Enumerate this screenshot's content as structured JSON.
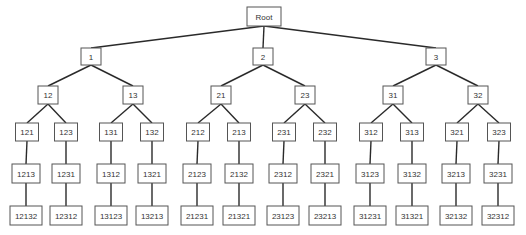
{
  "diagram": {
    "type": "tree",
    "root": "Root",
    "colors": {
      "edge": "#2a2a2a",
      "box_border": "#555555",
      "text": "#333333",
      "background": "#ffffff"
    },
    "levels": [
      {
        "y": 7,
        "h": 19,
        "nodes": [
          {
            "label": "Root",
            "cx": 264,
            "w": 34
          }
        ]
      },
      {
        "y": 48,
        "h": 17,
        "nodes": [
          {
            "label": "1",
            "cx": 91,
            "w": 20,
            "parent": "Root"
          },
          {
            "label": "2",
            "cx": 263,
            "w": 20,
            "parent": "Root"
          },
          {
            "label": "3",
            "cx": 436,
            "w": 20,
            "parent": "Root"
          }
        ]
      },
      {
        "y": 86,
        "h": 18,
        "nodes": [
          {
            "label": "12",
            "cx": 48,
            "w": 20,
            "parent": "1"
          },
          {
            "label": "13",
            "cx": 133,
            "w": 20,
            "parent": "1"
          },
          {
            "label": "21",
            "cx": 221,
            "w": 20,
            "parent": "2"
          },
          {
            "label": "23",
            "cx": 305,
            "w": 20,
            "parent": "2"
          },
          {
            "label": "31",
            "cx": 393,
            "w": 20,
            "parent": "3"
          },
          {
            "label": "32",
            "cx": 478,
            "w": 20,
            "parent": "3"
          }
        ]
      },
      {
        "y": 123,
        "h": 18,
        "nodes": [
          {
            "label": "121",
            "cx": 27,
            "w": 23,
            "parent": "12"
          },
          {
            "label": "123",
            "cx": 66,
            "w": 23,
            "parent": "12"
          },
          {
            "label": "131",
            "cx": 111,
            "w": 23,
            "parent": "13"
          },
          {
            "label": "132",
            "cx": 152,
            "w": 23,
            "parent": "13"
          },
          {
            "label": "212",
            "cx": 198,
            "w": 23,
            "parent": "21"
          },
          {
            "label": "213",
            "cx": 239,
            "w": 23,
            "parent": "21"
          },
          {
            "label": "231",
            "cx": 284,
            "w": 23,
            "parent": "23"
          },
          {
            "label": "232",
            "cx": 325,
            "w": 23,
            "parent": "23"
          },
          {
            "label": "312",
            "cx": 371,
            "w": 23,
            "parent": "31"
          },
          {
            "label": "313",
            "cx": 412,
            "w": 23,
            "parent": "31"
          },
          {
            "label": "321",
            "cx": 457,
            "w": 23,
            "parent": "32"
          },
          {
            "label": "323",
            "cx": 499,
            "w": 23,
            "parent": "32"
          }
        ]
      },
      {
        "y": 164,
        "h": 19,
        "nodes": [
          {
            "label": "1213",
            "cx": 26,
            "w": 28,
            "parent": "121"
          },
          {
            "label": "1231",
            "cx": 66,
            "w": 28,
            "parent": "123"
          },
          {
            "label": "1312",
            "cx": 111,
            "w": 28,
            "parent": "131"
          },
          {
            "label": "1321",
            "cx": 152,
            "w": 28,
            "parent": "132"
          },
          {
            "label": "2123",
            "cx": 197,
            "w": 28,
            "parent": "212"
          },
          {
            "label": "2132",
            "cx": 239,
            "w": 28,
            "parent": "213"
          },
          {
            "label": "2312",
            "cx": 283,
            "w": 28,
            "parent": "231"
          },
          {
            "label": "2321",
            "cx": 325,
            "w": 28,
            "parent": "232"
          },
          {
            "label": "3123",
            "cx": 370,
            "w": 28,
            "parent": "312"
          },
          {
            "label": "3132",
            "cx": 412,
            "w": 28,
            "parent": "313"
          },
          {
            "label": "3213",
            "cx": 456,
            "w": 28,
            "parent": "321"
          },
          {
            "label": "3231",
            "cx": 498,
            "w": 28,
            "parent": "323"
          }
        ]
      },
      {
        "y": 206,
        "h": 19,
        "nodes": [
          {
            "label": "12132",
            "cx": 26,
            "w": 32,
            "parent": "1213"
          },
          {
            "label": "12312",
            "cx": 66,
            "w": 32,
            "parent": "1231"
          },
          {
            "label": "13123",
            "cx": 111,
            "w": 32,
            "parent": "1312"
          },
          {
            "label": "13213",
            "cx": 152,
            "w": 32,
            "parent": "1321"
          },
          {
            "label": "21231",
            "cx": 197,
            "w": 32,
            "parent": "2123"
          },
          {
            "label": "21321",
            "cx": 239,
            "w": 32,
            "parent": "2132"
          },
          {
            "label": "23123",
            "cx": 283,
            "w": 32,
            "parent": "2312"
          },
          {
            "label": "23213",
            "cx": 325,
            "w": 32,
            "parent": "2321"
          },
          {
            "label": "31231",
            "cx": 370,
            "w": 32,
            "parent": "3123"
          },
          {
            "label": "31321",
            "cx": 412,
            "w": 32,
            "parent": "3132"
          },
          {
            "label": "32132",
            "cx": 456,
            "w": 32,
            "parent": "3213"
          },
          {
            "label": "32312",
            "cx": 498,
            "w": 32,
            "parent": "3231"
          }
        ]
      }
    ]
  }
}
